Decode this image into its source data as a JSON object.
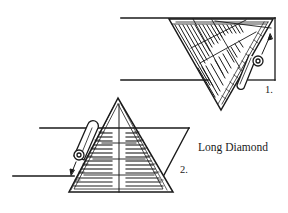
{
  "diagram": {
    "caption": "Long Diamond",
    "steps": [
      {
        "number": "1.",
        "description": "Triangle pinned along fabric strip, point at upper right, tool pinned along right edge"
      },
      {
        "number": "2.",
        "description": "Triangle upright (pyramid) across fabric strip, tool pinned along left edge"
      }
    ],
    "colors": {
      "ink": "#1a1a1a",
      "background": "#ffffff"
    }
  }
}
